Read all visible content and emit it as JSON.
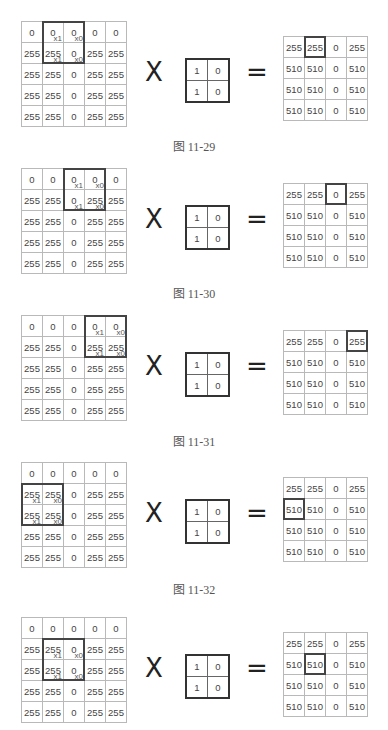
{
  "kernel": [
    [
      "1",
      "0"
    ],
    [
      "1",
      "0"
    ]
  ],
  "operators": {
    "multiply": "X",
    "equals": "="
  },
  "panels": [
    {
      "caption": "图 11-29",
      "input": [
        [
          "0",
          "0",
          "0",
          "0",
          "0"
        ],
        [
          "255",
          "255",
          "0",
          "255",
          "255"
        ],
        [
          "255",
          "255",
          "0",
          "255",
          "255"
        ],
        [
          "255",
          "255",
          "0",
          "255",
          "255"
        ],
        [
          "255",
          "255",
          "0",
          "255",
          "255"
        ]
      ],
      "window": {
        "row": 0,
        "col": 1
      },
      "multipliers": [
        [
          "x1",
          "x0"
        ],
        [
          "x1",
          "x0"
        ]
      ],
      "output": [
        [
          "255",
          "255",
          "0",
          "255"
        ],
        [
          "510",
          "510",
          "0",
          "510"
        ],
        [
          "510",
          "510",
          "0",
          "510"
        ],
        [
          "510",
          "510",
          "0",
          "510"
        ]
      ],
      "highlight": {
        "row": 0,
        "col": 1
      }
    },
    {
      "caption": "图 11-30",
      "input": [
        [
          "0",
          "0",
          "0",
          "0",
          "0"
        ],
        [
          "255",
          "255",
          "0",
          "255",
          "255"
        ],
        [
          "255",
          "255",
          "0",
          "255",
          "255"
        ],
        [
          "255",
          "255",
          "0",
          "255",
          "255"
        ],
        [
          "255",
          "255",
          "0",
          "255",
          "255"
        ]
      ],
      "window": {
        "row": 0,
        "col": 2
      },
      "multipliers": [
        [
          "x1",
          "x0"
        ],
        [
          "x1",
          "x0"
        ]
      ],
      "output": [
        [
          "255",
          "255",
          "0",
          "255"
        ],
        [
          "510",
          "510",
          "0",
          "510"
        ],
        [
          "510",
          "510",
          "0",
          "510"
        ],
        [
          "510",
          "510",
          "0",
          "510"
        ]
      ],
      "highlight": {
        "row": 0,
        "col": 2
      }
    },
    {
      "caption": "图 11-31",
      "input": [
        [
          "0",
          "0",
          "0",
          "0",
          "0"
        ],
        [
          "255",
          "255",
          "0",
          "255",
          "255"
        ],
        [
          "255",
          "255",
          "0",
          "255",
          "255"
        ],
        [
          "255",
          "255",
          "0",
          "255",
          "255"
        ],
        [
          "255",
          "255",
          "0",
          "255",
          "255"
        ]
      ],
      "window": {
        "row": 0,
        "col": 3
      },
      "multipliers": [
        [
          "x1",
          "x0"
        ],
        [
          "x1",
          "x0"
        ]
      ],
      "output": [
        [
          "255",
          "255",
          "0",
          "255"
        ],
        [
          "510",
          "510",
          "0",
          "510"
        ],
        [
          "510",
          "510",
          "0",
          "510"
        ],
        [
          "510",
          "510",
          "0",
          "510"
        ]
      ],
      "highlight": {
        "row": 0,
        "col": 3
      }
    },
    {
      "caption": "图 11-32",
      "input": [
        [
          "0",
          "0",
          "0",
          "0",
          "0"
        ],
        [
          "255",
          "255",
          "0",
          "255",
          "255"
        ],
        [
          "255",
          "255",
          "0",
          "255",
          "255"
        ],
        [
          "255",
          "255",
          "0",
          "255",
          "255"
        ],
        [
          "255",
          "255",
          "0",
          "255",
          "255"
        ]
      ],
      "window": {
        "row": 1,
        "col": 0
      },
      "multipliers": [
        [
          "x1",
          "x0"
        ],
        [
          "x1",
          "x0"
        ]
      ],
      "output": [
        [
          "255",
          "255",
          "0",
          "255"
        ],
        [
          "510",
          "510",
          "0",
          "510"
        ],
        [
          "510",
          "510",
          "0",
          "510"
        ],
        [
          "510",
          "510",
          "0",
          "510"
        ]
      ],
      "highlight": {
        "row": 1,
        "col": 0
      }
    },
    {
      "caption": "",
      "input": [
        [
          "0",
          "0",
          "0",
          "0",
          "0"
        ],
        [
          "255",
          "255",
          "0",
          "255",
          "255"
        ],
        [
          "255",
          "255",
          "0",
          "255",
          "255"
        ],
        [
          "255",
          "255",
          "0",
          "255",
          "255"
        ],
        [
          "255",
          "255",
          "0",
          "255",
          "255"
        ]
      ],
      "window": {
        "row": 1,
        "col": 1
      },
      "multipliers": [
        [
          "x1",
          "x0"
        ],
        [
          "x1",
          "x0"
        ]
      ],
      "output": [
        [
          "255",
          "255",
          "0",
          "255"
        ],
        [
          "510",
          "510",
          "0",
          "510"
        ],
        [
          "510",
          "510",
          "0",
          "510"
        ],
        [
          "510",
          "510",
          "0",
          "510"
        ]
      ],
      "highlight": {
        "row": 1,
        "col": 1
      }
    }
  ]
}
